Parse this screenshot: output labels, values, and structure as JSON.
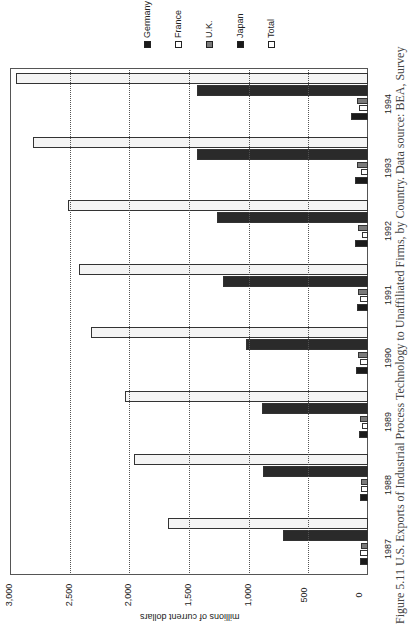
{
  "chart_data": {
    "type": "bar",
    "orientation": "rotated-90 (printed page sideways; value axis runs horizontally)",
    "title": "",
    "caption": "Figure 5.11  U.S. Exports of Industrial Process Technology to Unaffiliated Firms, by Country. Data source: BEA, Survey",
    "xlabel": "",
    "ylabel": "millions of current dollars",
    "ylim": [
      0,
      3000
    ],
    "yticks": [
      "0",
      "500",
      "1,000",
      "1,500",
      "2,000",
      "2,500",
      "3,000"
    ],
    "grid": true,
    "legend_position": "top-right",
    "categories": [
      "1987",
      "1988",
      "1989",
      "1990",
      "1991",
      "1992",
      "1993",
      "1994"
    ],
    "series": [
      {
        "name": "Germany",
        "color": "#1a1a1a",
        "values": [
          65,
          65,
          75,
          100,
          95,
          105,
          105,
          140
        ]
      },
      {
        "name": "France",
        "color": "#ffffff",
        "values": [
          70,
          60,
          50,
          70,
          65,
          50,
          60,
          75
        ]
      },
      {
        "name": "U.K.",
        "color": "#7a7a7a",
        "values": [
          55,
          60,
          70,
          80,
          80,
          85,
          90,
          90
        ]
      },
      {
        "name": "Japan",
        "color": "#2a2a2a",
        "values": [
          715,
          880,
          890,
          1025,
          1215,
          1265,
          1430,
          1435
        ]
      },
      {
        "name": "Total",
        "color": "#f4f4f4",
        "values": [
          1675,
          1960,
          2040,
          2325,
          2425,
          2515,
          2810,
          2950
        ]
      }
    ]
  },
  "legend": [
    {
      "label": "Germany",
      "color": "#1a1a1a"
    },
    {
      "label": "France",
      "color": "#ffffff"
    },
    {
      "label": "U.K.",
      "color": "#7a7a7a"
    },
    {
      "label": "Japan",
      "color": "#1a1a1a"
    },
    {
      "label": "Total",
      "color": "#ffffff"
    }
  ]
}
